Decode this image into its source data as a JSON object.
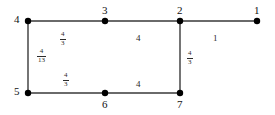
{
  "diagram": {
    "background_color": "#ffffff",
    "edge_color": "#3a3a3a",
    "node_color": "#000000",
    "label_color": "#111111",
    "width": 275,
    "height": 115,
    "node_radius": 3.2,
    "edge_width": 1.4,
    "nodes": [
      {
        "id": "n1",
        "label": "1",
        "x": 257,
        "y": 21,
        "label_x": 254,
        "label_y": 5
      },
      {
        "id": "n2",
        "label": "2",
        "x": 180,
        "y": 21,
        "label_x": 177,
        "label_y": 5
      },
      {
        "id": "n3",
        "label": "3",
        "x": 105,
        "y": 21,
        "label_x": 102,
        "label_y": 5
      },
      {
        "id": "n4",
        "label": "4",
        "x": 28,
        "y": 21,
        "label_x": 14,
        "label_y": 14
      },
      {
        "id": "n5",
        "label": "5",
        "x": 28,
        "y": 93,
        "label_x": 14,
        "label_y": 86
      },
      {
        "id": "n6",
        "label": "6",
        "x": 105,
        "y": 93,
        "label_x": 102,
        "label_y": 99
      },
      {
        "id": "n7",
        "label": "7",
        "x": 180,
        "y": 93,
        "label_x": 177,
        "label_y": 99
      }
    ],
    "edges": [
      {
        "id": "e43",
        "from": "n4",
        "to": "n3",
        "x1": 28,
        "y1": 21,
        "x2": 105,
        "y2": 21
      },
      {
        "id": "e32",
        "from": "n3",
        "to": "n2",
        "x1": 105,
        "y1": 21,
        "x2": 180,
        "y2": 21
      },
      {
        "id": "e21",
        "from": "n2",
        "to": "n1",
        "x1": 180,
        "y1": 21,
        "x2": 257,
        "y2": 21
      },
      {
        "id": "e45",
        "from": "n4",
        "to": "n5",
        "x1": 28,
        "y1": 21,
        "x2": 28,
        "y2": 93
      },
      {
        "id": "e27",
        "from": "n2",
        "to": "n7",
        "x1": 180,
        "y1": 21,
        "x2": 180,
        "y2": 93
      },
      {
        "id": "e56",
        "from": "n5",
        "to": "n6",
        "x1": 28,
        "y1": 93,
        "x2": 105,
        "y2": 93
      },
      {
        "id": "e67",
        "from": "n6",
        "to": "n7",
        "x1": 105,
        "y1": 93,
        "x2": 180,
        "y2": 93
      }
    ],
    "edge_labels": [
      {
        "id": "w43",
        "edge": "e43",
        "kind": "fraction",
        "numerator": "4",
        "denominator": "3",
        "x": 60,
        "y": 31
      },
      {
        "id": "w32",
        "edge": "e32",
        "kind": "integer",
        "text": "4",
        "x": 136,
        "y": 34
      },
      {
        "id": "w21",
        "edge": "e21",
        "kind": "integer",
        "text": "1",
        "x": 213,
        "y": 34
      },
      {
        "id": "w45",
        "edge": "e45",
        "kind": "fraction",
        "numerator": "4",
        "denominator": "13",
        "x": 37,
        "y": 48
      },
      {
        "id": "w27",
        "edge": "e27",
        "kind": "fraction",
        "numerator": "4",
        "denominator": "3",
        "x": 187,
        "y": 50
      },
      {
        "id": "w56",
        "edge": "e56",
        "kind": "fraction",
        "numerator": "4",
        "denominator": "3",
        "x": 63,
        "y": 72
      },
      {
        "id": "w67",
        "edge": "e67",
        "kind": "integer",
        "text": "4",
        "x": 136,
        "y": 80
      }
    ]
  }
}
